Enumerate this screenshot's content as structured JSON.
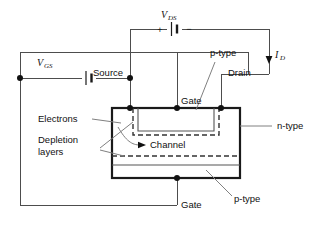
{
  "figure": {
    "type": "schematic-diagram"
  },
  "sources": {
    "vds": {
      "symbol": "V",
      "subscript": "DS",
      "plus": "+",
      "minus": "−"
    },
    "vgs": {
      "symbol": "V",
      "subscript": "GS"
    }
  },
  "current": {
    "symbol": "I",
    "subscript": "D"
  },
  "terminals": {
    "source": "Source",
    "drain": "Drain",
    "gate_top": "Gate",
    "gate_bottom": "Gate"
  },
  "regions": {
    "p_type_top": "p-type",
    "p_type_bottom": "p-type",
    "n_type": "n-type",
    "channel": "Channel"
  },
  "annotations": {
    "electrons": "Electrons",
    "depletion_line1": "Depletion",
    "depletion_line2": "layers"
  },
  "colors": {
    "wire": "#4d4d4d",
    "body_outline": "#1a1a1a",
    "leader": "#808080",
    "text": "#111111",
    "background": "#ffffff",
    "depletion_dash": "#333333"
  }
}
